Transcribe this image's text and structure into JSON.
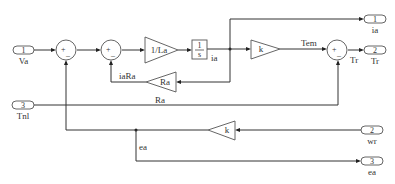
{
  "diagram": {
    "type": "simulink-block-diagram",
    "inports": [
      {
        "number": "1",
        "name": "Va"
      },
      {
        "number": "3",
        "name": "Tnl"
      },
      {
        "number": "2",
        "name": "wr"
      }
    ],
    "outports": [
      {
        "number": "1",
        "name": "ia"
      },
      {
        "number": "2",
        "name": "Tr"
      },
      {
        "number": "3",
        "name": "ea"
      }
    ],
    "gains": {
      "inv_la": "1/La",
      "ra": "Ra",
      "k_torque": "k",
      "k_emf": "k"
    },
    "gain_labels": {
      "ra_below": "Ra"
    },
    "integrator": {
      "num": "1",
      "den": "s"
    },
    "sums": {
      "sum1": {
        "plus": "+",
        "minus": "_"
      },
      "sum2": {
        "plus": "+",
        "minus": "_"
      },
      "sum3": {
        "plus": "+",
        "minus": "_"
      }
    },
    "signals": {
      "ia": "ia",
      "iaRa": "iaRa",
      "Tem": "Tem",
      "Tr": "Tr",
      "ea": "ea"
    }
  }
}
